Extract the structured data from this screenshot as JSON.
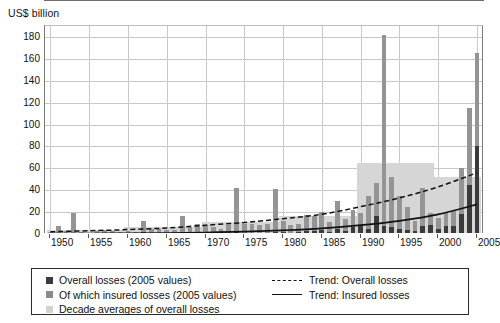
{
  "axis_title": "US$ billion",
  "legend": {
    "left_items": [
      {
        "label": "Overall losses (2005 values)",
        "swatch": "dark-square-swatch"
      },
      {
        "label": "Of which insured losses (2005 values)",
        "swatch": "gray-square-swatch"
      },
      {
        "label": "Decade averages of overall losses",
        "swatch": "light-gray-square-swatch"
      }
    ],
    "right_items": [
      {
        "label": "Trend: Overall losses",
        "swatch": "dashed-line-swatch"
      },
      {
        "label": "Trend: Insured losses",
        "swatch": "solid-line-swatch"
      }
    ]
  },
  "chart_data": {
    "type": "bar",
    "title": "",
    "subtitle": "",
    "xlabel": "",
    "ylabel": "US$ billion",
    "ylim": [
      0,
      190
    ],
    "xlim": [
      1949.3,
      2005.9
    ],
    "grid": true,
    "legend_position": "bottom",
    "ytick_labels": [
      "0",
      "20",
      "40",
      "60",
      "80",
      "100",
      "120",
      "140",
      "160",
      "180"
    ],
    "yticks": [
      0,
      20,
      40,
      60,
      80,
      100,
      120,
      140,
      160,
      180
    ],
    "xtick_labels": [
      "1950",
      "1955",
      "1960",
      "1965",
      "1970",
      "1975",
      "1980",
      "1985",
      "1990",
      "1995",
      "2000",
      "2005"
    ],
    "xticks": [
      1950,
      1955,
      1960,
      1965,
      1970,
      1975,
      1980,
      1985,
      1990,
      1995,
      2000,
      2005
    ],
    "years": [
      1950,
      1951,
      1952,
      1953,
      1954,
      1955,
      1956,
      1957,
      1958,
      1959,
      1960,
      1961,
      1962,
      1963,
      1964,
      1965,
      1966,
      1967,
      1968,
      1969,
      1970,
      1971,
      1972,
      1973,
      1974,
      1975,
      1976,
      1977,
      1978,
      1979,
      1980,
      1981,
      1982,
      1983,
      1984,
      1985,
      1986,
      1987,
      1988,
      1989,
      1990,
      1991,
      1992,
      1993,
      1994,
      1995,
      1996,
      1997,
      1998,
      1999,
      2000,
      2001,
      2002,
      2003,
      2004,
      2005
    ],
    "series": [
      {
        "name": "Overall losses (2005 values)",
        "color": "#949494",
        "values": [
          2,
          7,
          3,
          19,
          2,
          1,
          3,
          4,
          3,
          2,
          3,
          2,
          12,
          5,
          5,
          4,
          4,
          16,
          6,
          9,
          8,
          6,
          5,
          8,
          42,
          9,
          9,
          8,
          9,
          41,
          12,
          8,
          9,
          17,
          16,
          20,
          11,
          30,
          14,
          22,
          19,
          35,
          47,
          182,
          52,
          35,
          25,
          12,
          42,
          19,
          15,
          19,
          21,
          60,
          115,
          165
        ]
      },
      {
        "name": "Of which insured losses (2005 values)",
        "color": "#3b3b3b",
        "values": [
          0,
          0,
          0,
          1,
          0,
          0,
          0,
          0,
          0,
          0,
          0,
          0,
          2,
          0,
          0,
          0,
          0,
          1,
          0,
          1,
          1,
          1,
          1,
          1,
          2,
          1,
          1,
          1,
          1,
          2,
          2,
          1,
          2,
          3,
          3,
          4,
          2,
          5,
          3,
          6,
          8,
          5,
          16,
          7,
          6,
          5,
          4,
          3,
          7,
          8,
          5,
          7,
          7,
          18,
          45,
          80
        ]
      }
    ],
    "decade_averages": [
      {
        "decade": "1950-1959",
        "start_year": 1950,
        "end_year": 1959,
        "value": 3.9
      },
      {
        "decade": "1960-1969",
        "start_year": 1960,
        "end_year": 1969,
        "value": 6.6
      },
      {
        "decade": "1970-1979",
        "start_year": 1970,
        "end_year": 1979,
        "value": 10.8
      },
      {
        "decade": "1980-1989",
        "start_year": 1980,
        "end_year": 1989,
        "value": 16.0
      },
      {
        "decade": "1990-1999",
        "start_year": 1990,
        "end_year": 1999,
        "value": 65.0
      },
      {
        "decade": "2000-2005",
        "start_year": 2000,
        "end_year": 2005,
        "value": 52.0
      }
    ],
    "trend_overall": {
      "name": "Trend: Overall losses",
      "style": "dashed",
      "color": "#111111",
      "points": [
        [
          1950,
          2
        ],
        [
          1955,
          3
        ],
        [
          1960,
          4
        ],
        [
          1965,
          5.5
        ],
        [
          1970,
          8
        ],
        [
          1975,
          10.5
        ],
        [
          1980,
          14
        ],
        [
          1985,
          18
        ],
        [
          1990,
          25
        ],
        [
          1995,
          33
        ],
        [
          2000,
          43
        ],
        [
          2005,
          56
        ]
      ]
    },
    "trend_insured": {
      "name": "Trend: Insured losses",
      "style": "solid",
      "color": "#111111",
      "points": [
        [
          1950,
          0.3
        ],
        [
          1955,
          0.4
        ],
        [
          1960,
          0.6
        ],
        [
          1965,
          0.9
        ],
        [
          1970,
          1.4
        ],
        [
          1975,
          2.2
        ],
        [
          1980,
          3.4
        ],
        [
          1985,
          5.2
        ],
        [
          1990,
          8
        ],
        [
          1995,
          12
        ],
        [
          2000,
          18
        ],
        [
          2005,
          27
        ]
      ]
    }
  }
}
